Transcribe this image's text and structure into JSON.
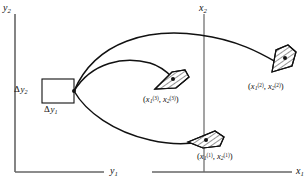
{
  "figure": {
    "axes": {
      "left_plot": {
        "vertical_axis_label": "y",
        "vertical_axis_sub": "2",
        "horizontal_axis_label": "y",
        "horizontal_axis_sub": "1"
      },
      "right_plot": {
        "vertical_axis_label": "x",
        "vertical_axis_sub": "2",
        "horizontal_axis_label": "x",
        "horizontal_axis_sub": "1"
      }
    },
    "deltas": {
      "vertical": {
        "symbol": "Δ",
        "var": "y",
        "sub": "2"
      },
      "horizontal": {
        "symbol": "Δ",
        "var": "y",
        "sub": "1"
      }
    },
    "points": [
      {
        "id": "point-1",
        "label_open": "(",
        "var1": "x",
        "sub1": "1",
        "sup1": "(1)",
        "separator": ", ",
        "var2": "x",
        "sub2": "2",
        "sup2": "(1)",
        "label_close": ")"
      },
      {
        "id": "point-2",
        "label_open": "(",
        "var1": "x",
        "sub1": "1",
        "sup1": "(2)",
        "separator": ", ",
        "var2": "x",
        "sub2": "2",
        "sup2": "(2)",
        "label_close": ")"
      },
      {
        "id": "point-3",
        "label_open": "(",
        "var1": "x",
        "sub1": "1",
        "sup1": "(3)",
        "separator": ", ",
        "var2": "x",
        "sub2": "2",
        "sup2": "(3)",
        "label_close": ")"
      }
    ],
    "colors": {
      "stroke": "#111111",
      "axis": "#555555",
      "background": "#ffffff",
      "hatch": "#111111"
    }
  }
}
